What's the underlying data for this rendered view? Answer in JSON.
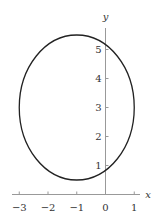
{
  "chart_data": {
    "type": "line",
    "title": "",
    "xlabel": "x",
    "ylabel": "y",
    "xlim": [
      -3.3,
      1.3
    ],
    "ylim": [
      0,
      5.9
    ],
    "x_ticks": [
      -3,
      -2,
      -1,
      0,
      1
    ],
    "y_ticks": [
      1,
      2,
      3,
      4,
      5
    ],
    "x_tick_labels": [
      "−3",
      "−2",
      "−1",
      "0",
      "1"
    ],
    "y_tick_labels": [
      "1",
      "2",
      "3",
      "4",
      "5"
    ],
    "grid": false,
    "legend": null,
    "series": [
      {
        "name": "ellipse",
        "shape": "ellipse",
        "center": [
          -1,
          3
        ],
        "semi_axis_x": 2,
        "semi_axis_y": 2.5,
        "equation": "(x+1)^2/4 + (y-3)^2/6.25 = 1"
      }
    ]
  }
}
